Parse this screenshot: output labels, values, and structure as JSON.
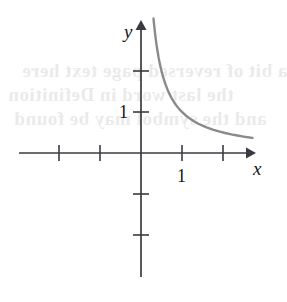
{
  "figure": {
    "title": "",
    "background_color": "#ffffff"
  },
  "axes": {
    "x_axis_label": "x",
    "y_axis_label": "y",
    "x_tick_label": "1",
    "y_tick_label": "1",
    "axis_color": "#3a3a40",
    "curve_color": "#8a8a8a"
  },
  "bleed_text": {
    "line1": "a bit of reversed page text here",
    "line2": "the last word in Definition",
    "line3": "and the symbol may be found"
  },
  "chart_data": {
    "type": "line",
    "title": "",
    "xlabel": "x",
    "ylabel": "y",
    "xlim": [
      -3.0,
      2.95
    ],
    "ylim": [
      -3.05,
      3.25
    ],
    "grid": false,
    "legend": null,
    "x_ticks": [
      -2,
      -1,
      1,
      2
    ],
    "y_ticks": [
      -2,
      -1,
      1,
      2
    ],
    "x_tick_labels": [
      "",
      "",
      "1",
      ""
    ],
    "y_tick_labels": [
      "",
      "1",
      "",
      ""
    ],
    "origin_px": [
      141,
      153
    ],
    "unit_px": 41,
    "series": [
      {
        "name": "y = 1/x",
        "equation": "1/x",
        "x": [
          0.305,
          0.32,
          0.34,
          0.36,
          0.38,
          0.4,
          0.43,
          0.46,
          0.5,
          0.55,
          0.6,
          0.65,
          0.7,
          0.75,
          0.8,
          0.85,
          0.9,
          0.95,
          1.0,
          1.1,
          1.2,
          1.3,
          1.4,
          1.5,
          1.6,
          1.75,
          1.9,
          2.05,
          2.2,
          2.35,
          2.5,
          2.65,
          2.72
        ],
        "y": [
          3.279,
          3.125,
          2.941,
          2.778,
          2.632,
          2.5,
          2.326,
          2.174,
          2.0,
          1.818,
          1.667,
          1.538,
          1.429,
          1.333,
          1.25,
          1.176,
          1.111,
          1.053,
          1.0,
          0.909,
          0.833,
          0.769,
          0.714,
          0.667,
          0.625,
          0.571,
          0.526,
          0.488,
          0.455,
          0.426,
          0.4,
          0.377,
          0.368
        ]
      }
    ]
  }
}
